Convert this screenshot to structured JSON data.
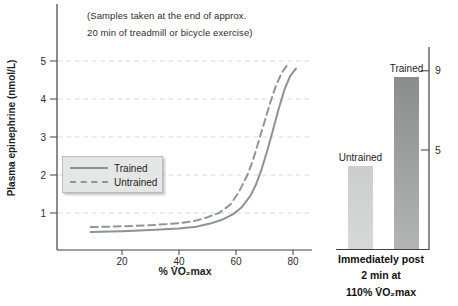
{
  "annotation": {
    "lines": [
      "(Samples taken at the end of approx.",
      "20 min of treadmill or bicycle exercise)"
    ]
  },
  "chart_data": [
    {
      "type": "line",
      "title": "(Samples taken at the end of approx. 20 min of treadmill or bicycle exercise)",
      "xlabel": "% V̇O₂max",
      "ylabel": "Plasma epinephrine (nmol/L)",
      "x_ticks": [
        20,
        40,
        60,
        80
      ],
      "x_tick_labels": [
        "20",
        "40",
        "60",
        "80"
      ],
      "y_ticks": [
        5,
        4,
        3,
        2,
        1
      ],
      "y_tick_labels": [
        "5",
        "4",
        "3",
        "2",
        "1"
      ],
      "xlim": [
        0,
        87
      ],
      "ylim": [
        0,
        5.6
      ],
      "grid": "horizontal dashed",
      "legend_position": "left-middle",
      "series": [
        {
          "name": "Trained",
          "line_style": "solid",
          "points": [
            [
              9,
              0.5
            ],
            [
              20,
              0.52
            ],
            [
              30,
              0.55
            ],
            [
              40,
              0.59
            ],
            [
              46,
              0.64
            ],
            [
              51,
              0.72
            ],
            [
              55,
              0.82
            ],
            [
              59,
              0.97
            ],
            [
              62,
              1.15
            ],
            [
              65,
              1.45
            ],
            [
              67,
              1.75
            ],
            [
              69,
              2.15
            ],
            [
              71,
              2.65
            ],
            [
              73,
              3.2
            ],
            [
              75,
              3.75
            ],
            [
              77,
              4.25
            ],
            [
              79,
              4.6
            ],
            [
              81,
              4.8
            ]
          ]
        },
        {
          "name": "Untrained",
          "line_style": "dashed",
          "points": [
            [
              9,
              0.63
            ],
            [
              20,
              0.65
            ],
            [
              30,
              0.68
            ],
            [
              40,
              0.73
            ],
            [
              46,
              0.8
            ],
            [
              50,
              0.89
            ],
            [
              54,
              1.0
            ],
            [
              58,
              1.22
            ],
            [
              61,
              1.55
            ],
            [
              64,
              2.0
            ],
            [
              66,
              2.4
            ],
            [
              68,
              2.9
            ],
            [
              70,
              3.4
            ],
            [
              72,
              3.9
            ],
            [
              74,
              4.35
            ],
            [
              76,
              4.68
            ],
            [
              78,
              4.9
            ]
          ]
        }
      ]
    },
    {
      "type": "bar",
      "categories": [
        "Untrained",
        "Trained"
      ],
      "values": [
        4.2,
        8.7
      ],
      "y_ticks": [
        9,
        5
      ],
      "y_tick_labels": [
        "9",
        "5"
      ],
      "ylim": [
        0,
        10.2
      ],
      "axis_side": "right",
      "caption_lines": [
        "Immediately post",
        "2 min at",
        "110% V̇O₂max"
      ]
    }
  ],
  "colors": {
    "text": "#222222",
    "axis": "#404040",
    "gridline": "#d6d9d8",
    "trained_line": "#8b9393",
    "untrained_line": "#8f9695",
    "legend_bg": "#e4e7e6",
    "legend_border": "#b8bcbb",
    "bar_trained_top": "#8a8d8c",
    "bar_trained_bottom": "#b2b5b4",
    "bar_untrained_top": "#cbcecd",
    "bar_untrained_bottom": "#d7d9d8"
  }
}
